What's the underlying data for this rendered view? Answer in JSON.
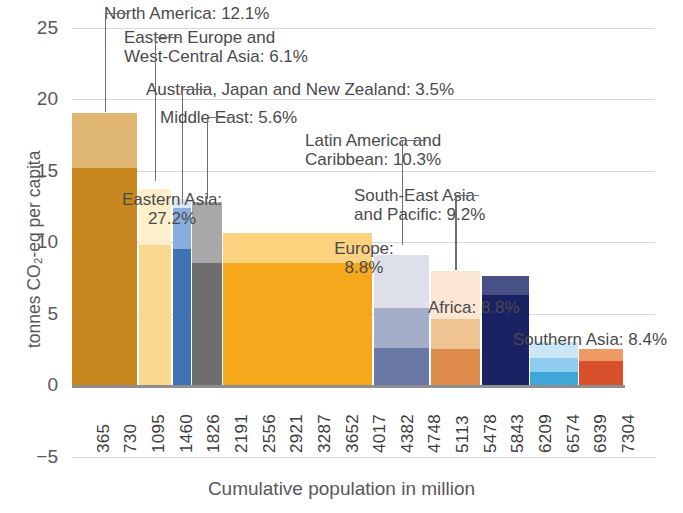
{
  "chart_data": {
    "type": "bar",
    "title": "",
    "xlabel": "Cumulative population in million",
    "ylabel": "tonnes CO₂-eq per capita",
    "ylim": [
      -5,
      27
    ],
    "yticks": [
      25,
      20,
      15,
      10,
      5,
      0,
      -5
    ],
    "grid": true,
    "legend_position": "none",
    "xtick_labels": [
      "365",
      "730",
      "1095",
      "1460",
      "1826",
      "2191",
      "2556",
      "2921",
      "3287",
      "3652",
      "4017",
      "4382",
      "4748",
      "5113",
      "5478",
      "5843",
      "6209",
      "6574",
      "6939",
      "7304"
    ],
    "x_unit": "million people (cumulative)",
    "note": "Variable-width stacked bars: width = share of world population (%), height = tonnes CO2-eq per capita",
    "regions": [
      {
        "name": "North America",
        "share_percent": 12.1,
        "label": "North America: 12.1%",
        "total": 19.0,
        "pop_start": 0,
        "pop_end": 884,
        "segments": [
          {
            "value": 15.2,
            "color": "#c8871f"
          },
          {
            "value": 3.8,
            "color": "#e0b873"
          }
        ]
      },
      {
        "name": "Eastern Europe and West-Central Asia",
        "share_percent": 6.1,
        "label": "Eastern Europe and\nWest-Central Asia: 6.1%",
        "total": 13.7,
        "pop_start": 884,
        "pop_end": 1330,
        "segments": [
          {
            "value": 9.8,
            "color": "#f7d88c"
          },
          {
            "value": 3.9,
            "color": "#fcefc9"
          }
        ]
      },
      {
        "name": "Australia, Japan and New Zealand",
        "share_percent": 3.5,
        "label": "Australia, Japan and New Zealand: 3.5%",
        "total": 13.0,
        "pop_start": 1330,
        "pop_end": 1586,
        "segments": [
          {
            "value": 9.5,
            "color": "#3f72b5"
          },
          {
            "value": 2.9,
            "color": "#89aede"
          },
          {
            "value": 0.6,
            "color": "#dce7f6"
          }
        ]
      },
      {
        "name": "Middle East",
        "share_percent": 5.6,
        "label": "Middle East: 5.6%",
        "total": 12.8,
        "pop_start": 1586,
        "pop_end": 2000,
        "segments": [
          {
            "value": 8.5,
            "color": "#6e6e6e"
          },
          {
            "value": 4.3,
            "color": "#a8a8a8"
          }
        ]
      },
      {
        "name": "Eastern Asia",
        "share_percent": 27.2,
        "label": "Eastern Asia:\n27.2%",
        "total": 10.6,
        "pop_start": 2000,
        "pop_end": 3987,
        "segments": [
          {
            "value": 8.5,
            "color": "#f5a81c"
          },
          {
            "value": 2.1,
            "color": "#fbd37e"
          }
        ]
      },
      {
        "name": "Latin America and Caribbean",
        "share_percent": 10.3,
        "label": "Latin America and\nCaribbean: 10.3%",
        "total": 9.1,
        "pop_start": 3987,
        "pop_end": 4739,
        "segments": [
          {
            "value": 2.6,
            "color": "#6977a4"
          },
          {
            "value": 2.8,
            "color": "#a5aec9"
          },
          {
            "value": 3.7,
            "color": "#dde0ea"
          }
        ]
      },
      {
        "name": "South-East Asia and Pacific",
        "share_percent": 9.2,
        "label": "South-East Asia\nand Pacific: 9.2%",
        "total": 8.0,
        "pop_start": 4739,
        "pop_end": 5411,
        "segments": [
          {
            "value": 2.5,
            "color": "#df8b4c"
          },
          {
            "value": 2.1,
            "color": "#f0c392"
          },
          {
            "value": 3.4,
            "color": "#fae6d3"
          }
        ]
      },
      {
        "name": "Europe",
        "share_percent": 8.8,
        "label": "Europe:\n8.8%",
        "total": 7.6,
        "pop_start": 5411,
        "pop_end": 6054,
        "segments": [
          {
            "value": 6.3,
            "color": "#1b2263"
          },
          {
            "value": 1.3,
            "color": "#4a5186"
          }
        ]
      },
      {
        "name": "Africa",
        "share_percent": 8.8,
        "label": "Africa: 8.8%",
        "total": 3.0,
        "pop_start": 6054,
        "pop_end": 6697,
        "segments": [
          {
            "value": 0.9,
            "color": "#3fa8d8"
          },
          {
            "value": 1.0,
            "color": "#8fcced"
          },
          {
            "value": 1.1,
            "color": "#cbe7f7"
          }
        ]
      },
      {
        "name": "Southern Asia",
        "share_percent": 8.4,
        "label": "Southern Asia: 8.4%",
        "total": 2.5,
        "pop_start": 6697,
        "pop_end": 7304,
        "segments": [
          {
            "value": 1.7,
            "color": "#d9512c"
          },
          {
            "value": 0.8,
            "color": "#ef9a62"
          }
        ]
      }
    ]
  },
  "annotations": [
    {
      "id": "north-america",
      "text": "North America: 12.1%",
      "align": "left",
      "x": 104,
      "y": 4,
      "leader": {
        "bar": 0,
        "top": 13,
        "bottom": 112,
        "hook": 24
      }
    },
    {
      "id": "eastern-europe",
      "text": "Eastern Europe and\nWest-Central Asia: 6.1%",
      "align": "left",
      "x": 124,
      "y": 28,
      "leader": {
        "bar": 1,
        "top": 37,
        "bottom": 181,
        "hook": 24
      }
    },
    {
      "id": "australia-japan-nz",
      "text": "Australia, Japan and New Zealand: 3.5%",
      "align": "left",
      "x": 146,
      "y": 80,
      "leader": {
        "bar": 2,
        "top": 89,
        "bottom": 204,
        "hook": 24
      }
    },
    {
      "id": "middle-east",
      "text": "Middle East: 5.6%",
      "align": "left",
      "x": 160,
      "y": 108,
      "leader": {
        "bar": 3,
        "top": 117,
        "bottom": 199,
        "hook": 24
      }
    },
    {
      "id": "eastern-asia",
      "text": "Eastern Asia:\n27.2%",
      "align": "center",
      "x": 172,
      "y": 190,
      "leader": null
    },
    {
      "id": "latin-america",
      "text": "Latin America and\nCaribbean: 10.3%",
      "align": "left",
      "x": 305,
      "y": 131,
      "leader": {
        "bar": 5,
        "top": 140,
        "bottom": 245,
        "hook": 24
      }
    },
    {
      "id": "south-east-asia",
      "text": "South-East Asia\nand Pacific: 9.2%",
      "align": "left",
      "x": 354,
      "y": 186,
      "leader": {
        "bar": 6,
        "top": 195,
        "bottom": 270,
        "hook": 24
      }
    },
    {
      "id": "europe",
      "text": "Europe:\n8.8%",
      "align": "center",
      "x": 364,
      "y": 239,
      "leader": null
    },
    {
      "id": "africa",
      "text": "Africa: 8.8%",
      "align": "left",
      "x": 428,
      "y": 298,
      "leader": null
    },
    {
      "id": "southern-asia",
      "text": "Southern Asia: 8.4%",
      "align": "left",
      "x": 513,
      "y": 330,
      "leader": null
    }
  ],
  "plot_geometry": {
    "left": 72,
    "right": 625,
    "top": 20,
    "y_zero": 385,
    "y_top_value": 27,
    "px_per_unit": 14.3,
    "x_axis_label_y": 470
  }
}
